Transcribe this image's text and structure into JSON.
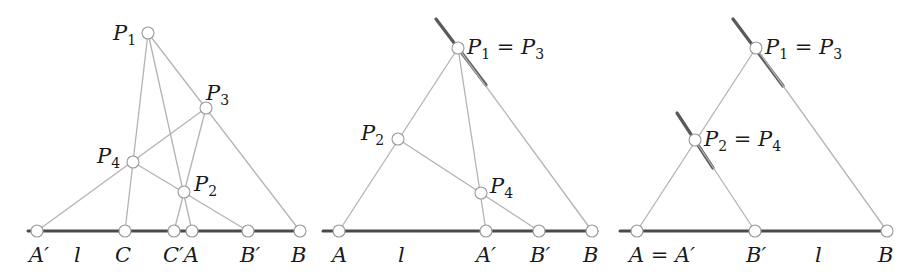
{
  "figure": {
    "panels": [
      {
        "id": "panel-1",
        "baseline": {
          "x1": 28,
          "x2": 300,
          "y": 231
        },
        "points": [
          {
            "name": "P1",
            "x": 148,
            "y": 33
          },
          {
            "name": "P3",
            "x": 206,
            "y": 108
          },
          {
            "name": "P4",
            "x": 133,
            "y": 162
          },
          {
            "name": "P2",
            "x": 184,
            "y": 192
          },
          {
            "name": "A'",
            "x": 37,
            "y": 231
          },
          {
            "name": "C",
            "x": 125,
            "y": 231
          },
          {
            "name": "C'",
            "x": 174,
            "y": 231
          },
          {
            "name": "A",
            "x": 192,
            "y": 231
          },
          {
            "name": "B'",
            "x": 248,
            "y": 231
          },
          {
            "name": "B",
            "x": 300,
            "y": 231
          }
        ],
        "segments": [
          [
            "P1",
            "C"
          ],
          [
            "P1",
            "A"
          ],
          [
            "P1",
            "B"
          ],
          [
            "P3",
            "A'"
          ],
          [
            "P3",
            "C'"
          ],
          [
            "P4",
            "B'"
          ]
        ],
        "labels": {
          "P1": "P",
          "P1_sub": "1",
          "P2": "P",
          "P2_sub": "2",
          "P3": "P",
          "P3_sub": "3",
          "P4": "P",
          "P4_sub": "4",
          "Aprime": "A′",
          "line": "l",
          "C": "C",
          "Cprime_A": "C′A",
          "Bprime": "B′",
          "B": "B"
        }
      },
      {
        "id": "panel-2",
        "baseline": {
          "x1": 323,
          "x2": 597,
          "y": 231
        },
        "points": [
          {
            "name": "P1=P3",
            "x": 458,
            "y": 48
          },
          {
            "name": "P2",
            "x": 398,
            "y": 139
          },
          {
            "name": "P4",
            "x": 481,
            "y": 193
          },
          {
            "name": "A",
            "x": 339,
            "y": 231
          },
          {
            "name": "A'",
            "x": 486,
            "y": 231
          },
          {
            "name": "B'",
            "x": 539,
            "y": 231
          },
          {
            "name": "B",
            "x": 592,
            "y": 231
          }
        ],
        "thick_segment": {
          "x1": 436,
          "y1": 19,
          "x2": 486,
          "y2": 85
        },
        "labels": {
          "P13": "P",
          "P13_sub1": "1",
          "P13_eq": " = P",
          "P13_sub2": "3",
          "P2": "P",
          "P2_sub": "2",
          "P4": "P",
          "P4_sub": "4",
          "A": "A",
          "line": "l",
          "Aprime": "A′",
          "Bprime": "B′",
          "B": "B"
        }
      },
      {
        "id": "panel-3",
        "baseline": {
          "x1": 620,
          "x2": 887,
          "y": 231
        },
        "points": [
          {
            "name": "P1=P3",
            "x": 756,
            "y": 48
          },
          {
            "name": "P2=P4",
            "x": 695,
            "y": 140
          },
          {
            "name": "A=A'",
            "x": 637,
            "y": 231
          },
          {
            "name": "B'",
            "x": 755,
            "y": 231
          },
          {
            "name": "B",
            "x": 887,
            "y": 231
          }
        ],
        "thick_segments": [
          {
            "x1": 733,
            "y1": 19,
            "x2": 783,
            "y2": 86
          },
          {
            "x1": 677,
            "y1": 113,
            "x2": 713,
            "y2": 168
          }
        ],
        "labels": {
          "P13": "P",
          "P13_sub1": "1",
          "P13_eq": " = P",
          "P13_sub2": "3",
          "P24": "P",
          "P24_sub1": "2",
          "P24_eq": " = P",
          "P24_sub2": "4",
          "AAprime": "A = A′",
          "Bprime": "B′",
          "line": "l",
          "B": "B"
        }
      }
    ],
    "colors": {
      "thin_line": "#b3b3b3",
      "baseline": "#4a4a4a",
      "thick_line": "#5a5a5a",
      "point_stroke": "#9a9a9a",
      "text": "#1a1a1a"
    }
  }
}
